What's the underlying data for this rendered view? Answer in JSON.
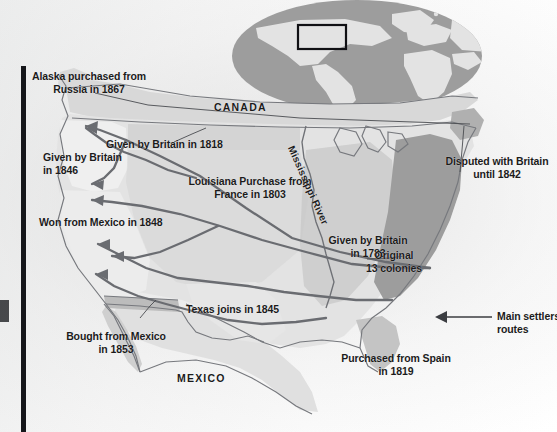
{
  "document": {
    "type": "historical-map",
    "subject": "Territorial expansion of the United States",
    "region": "North America"
  },
  "colors": {
    "paper": "#fdfdfd",
    "land_light": "#e9e9e9",
    "land_mid": "#cfcfcf",
    "land_dark": "#a9a9a9",
    "colonies_dark": "#9b9b9b",
    "ocean_globe": "#9c9c9c",
    "globe_land": "#e2e2e2",
    "route_line": "#6d6f74",
    "border_line": "#7d7f84",
    "text": "#1b1b1b",
    "spine": "#15161a"
  },
  "labels": {
    "alaska": "Alaska purchased from\nRussia in 1867",
    "canada": "CANADA",
    "mexico": "MEXICO",
    "oregon_1846": "Given by Britain\nin 1846",
    "north_1818": "Given by Britain in 1818",
    "louisiana": "Louisiana Purchase from\nFrance in 1803",
    "mexican_cession": "Won from Mexico in 1848",
    "gadsden": "Bought from Mexico\nin 1853",
    "texas": "Texas joins in 1845",
    "treaty_1783": "Given by Britain\nin 1783",
    "colonies": "Original\n13 colonies",
    "maine_dispute": "Disputed with Britain\nuntil 1842",
    "florida": "Purchased from Spain\nin 1819",
    "mississippi_river": "Mississippi River"
  },
  "legend": {
    "settlers_routes": "Main settlers'\nroutes",
    "arrow_icon": "left-arrow-icon"
  },
  "inset": {
    "name": "globe-locator-inset",
    "description": "World map ellipse with a highlight rectangle over North America",
    "highlight_box": "north-america"
  },
  "annotations": [
    {
      "text": "Alaska purchased from Russia in 1867",
      "territory": "Alaska",
      "year": 1867,
      "from": "Russia"
    },
    {
      "text": "Given by Britain in 1846",
      "territory": "Oregon Country",
      "year": 1846,
      "from": "Britain"
    },
    {
      "text": "Given by Britain in 1818",
      "territory": "Northern boundary cession",
      "year": 1818,
      "from": "Britain"
    },
    {
      "text": "Louisiana Purchase from France in 1803",
      "territory": "Louisiana Purchase",
      "year": 1803,
      "from": "France"
    },
    {
      "text": "Won from Mexico in 1848",
      "territory": "Mexican Cession",
      "year": 1848,
      "from": "Mexico"
    },
    {
      "text": "Bought from Mexico in 1853",
      "territory": "Gadsden Purchase",
      "year": 1853,
      "from": "Mexico"
    },
    {
      "text": "Texas joins in 1845",
      "territory": "Texas Annexation",
      "year": 1845,
      "from": "Texas"
    },
    {
      "text": "Given by Britain in 1783",
      "territory": "Treaty of Paris lands",
      "year": 1783,
      "from": "Britain"
    },
    {
      "text": "Original 13 colonies",
      "territory": "Thirteen Colonies",
      "year": null,
      "from": null
    },
    {
      "text": "Disputed with Britain until 1842",
      "territory": "Maine boundary",
      "year": 1842,
      "from": "Britain"
    },
    {
      "text": "Purchased from Spain in 1819",
      "territory": "Florida",
      "year": 1819,
      "from": "Spain"
    }
  ]
}
